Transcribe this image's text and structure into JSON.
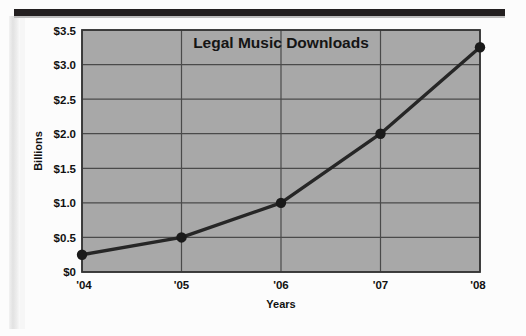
{
  "figure": {
    "title": "Legal Music Downloads",
    "xlabel": "Years",
    "ylabel": "Billions"
  },
  "ticks": {
    "y": [
      "$3.5",
      "$3.0",
      "$2.5",
      "$2.0",
      "$1.5",
      "$1.0",
      "$0.5",
      "$0"
    ],
    "x": [
      "'04",
      "'05",
      "'06",
      "'07",
      "'08"
    ]
  },
  "colors": {
    "plot_background": "#a8a8a8",
    "gridline": "#4a4a4a",
    "series_line": "#262626",
    "marker": "#1a1a1a",
    "text": "#111111",
    "top_rule": "#231f20"
  },
  "chart_data": {
    "type": "line",
    "title": "Legal Music Downloads",
    "xlabel": "Years",
    "ylabel": "Billions",
    "categories": [
      "'04",
      "'05",
      "'06",
      "'07",
      "'08"
    ],
    "values": [
      0.25,
      0.5,
      1.0,
      2.0,
      3.25
    ],
    "ylim": [
      0,
      3.5
    ],
    "yticks": [
      0,
      0.5,
      1.0,
      1.5,
      2.0,
      2.5,
      3.0,
      3.5
    ],
    "ytick_labels": [
      "$0",
      "$0.5",
      "$1.0",
      "$1.5",
      "$2.0",
      "$2.5",
      "$3.0",
      "$3.5"
    ],
    "grid": true,
    "legend": false,
    "marker": "circle",
    "series": [
      {
        "name": "Legal Music Downloads",
        "values": [
          0.25,
          0.5,
          1.0,
          2.0,
          3.25
        ]
      }
    ]
  }
}
